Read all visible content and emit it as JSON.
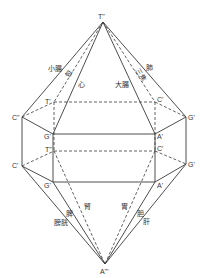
{
  "diagram": {
    "type": "crystal-bipyramid-schematic",
    "vertices": {
      "top": {
        "label": "T\"",
        "x": 103,
        "y": 22
      },
      "bottom": {
        "label": "A\"'",
        "x": 105,
        "y": 264
      },
      "upper_back_left": {
        "label": "T'",
        "x": 54,
        "y": 102
      },
      "upper_back_right": {
        "label": "C'",
        "x": 155,
        "y": 102
      },
      "upper_left": {
        "label": "C\"",
        "x": 22,
        "y": 117
      },
      "upper_right": {
        "label": "G'",
        "x": 186,
        "y": 117
      },
      "upper_front_left": {
        "label": "G'",
        "x": 53,
        "y": 134
      },
      "upper_front_right": {
        "label": "A'",
        "x": 155,
        "y": 134
      },
      "lower_back_left": {
        "label": "T\"",
        "x": 54,
        "y": 151
      },
      "lower_back_right": {
        "label": "C'",
        "x": 155,
        "y": 151
      },
      "lower_left": {
        "label": "C'",
        "x": 22,
        "y": 166
      },
      "lower_right": {
        "label": "G'",
        "x": 186,
        "y": 164
      },
      "lower_front_left": {
        "label": "G'",
        "x": 53,
        "y": 182
      },
      "lower_front_right": {
        "label": "A'",
        "x": 155,
        "y": 182
      }
    },
    "annotations": {
      "small_intestine": "小腸",
      "pericardium": "包",
      "heart": "心",
      "large_intestine": "大腸",
      "triple_burner": "三焦",
      "lung": "肺",
      "bladder": "膀胱",
      "spleen": "脾",
      "kidney": "腎",
      "stomach": "胃",
      "gallbladder": "胆",
      "liver": "肝"
    },
    "colors": {
      "line": "#3a3a3a",
      "text": "#333333",
      "background": "#ffffff"
    }
  }
}
